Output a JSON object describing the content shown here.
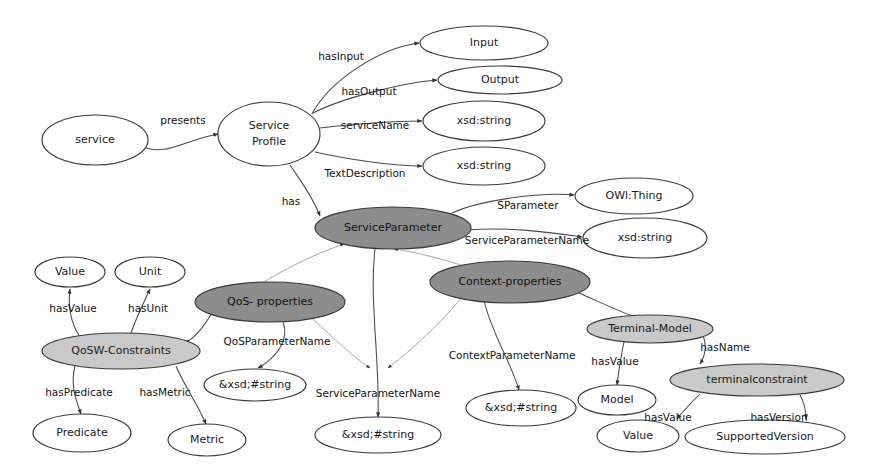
{
  "diagram": {
    "colors": {
      "node_fill_plain": "#ffffff",
      "node_fill_dark": "#8d8d8d",
      "node_fill_light": "#c9c9c9",
      "node_stroke": "#3a3a3a",
      "edge_stroke": "#4a4a4a",
      "edge_stroke_faint": "#9a9a9a",
      "background": "#fdfdfd",
      "text": "#141414"
    },
    "nodes": [
      {
        "id": "service",
        "label": "service",
        "cx": 95,
        "cy": 140,
        "rx": 53,
        "ry": 25,
        "fill": "plain",
        "lines": 1
      },
      {
        "id": "service-profile",
        "label": "Service\nProfile",
        "cx": 269,
        "cy": 134,
        "rx": 51,
        "ry": 32,
        "fill": "plain",
        "lines": 2,
        "line1": "Service",
        "line2": "Profile"
      },
      {
        "id": "input",
        "label": "Input",
        "cx": 484,
        "cy": 43,
        "rx": 64,
        "ry": 17,
        "fill": "plain",
        "lines": 1
      },
      {
        "id": "output",
        "label": "Output",
        "cx": 500,
        "cy": 80,
        "rx": 62,
        "ry": 14,
        "fill": "plain",
        "lines": 1
      },
      {
        "id": "xsd-string-name",
        "label": "xsd:string",
        "cx": 484,
        "cy": 121,
        "rx": 61,
        "ry": 20,
        "fill": "plain",
        "lines": 1
      },
      {
        "id": "xsd-string-desc",
        "label": "xsd:string",
        "cx": 484,
        "cy": 166,
        "rx": 61,
        "ry": 19,
        "fill": "plain",
        "lines": 1
      },
      {
        "id": "owl-thing",
        "label": "OWl:Thing",
        "cx": 634,
        "cy": 196,
        "rx": 59,
        "ry": 18,
        "fill": "plain",
        "lines": 1
      },
      {
        "id": "xsd-string-sparam",
        "label": "xsd:string",
        "cx": 645,
        "cy": 238,
        "rx": 62,
        "ry": 20,
        "fill": "plain",
        "lines": 1
      },
      {
        "id": "service-parameter",
        "label": "ServiceParameter",
        "cx": 393,
        "cy": 228,
        "rx": 78,
        "ry": 21,
        "fill": "dark",
        "lines": 1
      },
      {
        "id": "value-top",
        "label": "Value",
        "cx": 70,
        "cy": 272,
        "rx": 35,
        "ry": 15,
        "fill": "plain",
        "lines": 1
      },
      {
        "id": "unit",
        "label": "Unit",
        "cx": 150,
        "cy": 272,
        "rx": 35,
        "ry": 15,
        "fill": "plain",
        "lines": 1
      },
      {
        "id": "qos-properties",
        "label": "QoS- properties",
        "cx": 270,
        "cy": 302,
        "rx": 75,
        "ry": 20,
        "fill": "dark",
        "lines": 1
      },
      {
        "id": "context-properties",
        "label": "Context-properties",
        "cx": 510,
        "cy": 282,
        "rx": 80,
        "ry": 21,
        "fill": "dark",
        "lines": 1
      },
      {
        "id": "qosw-constraints",
        "label": "QoSW-Constraints",
        "cx": 121,
        "cy": 351,
        "rx": 79,
        "ry": 18,
        "fill": "light",
        "lines": 1
      },
      {
        "id": "terminal-model",
        "label": "Terminal-Model",
        "cx": 650,
        "cy": 329,
        "rx": 63,
        "ry": 14,
        "fill": "light",
        "lines": 1
      },
      {
        "id": "terminalconstraint",
        "label": "terminalconstraint",
        "cx": 757,
        "cy": 380,
        "rx": 87,
        "ry": 16,
        "fill": "light",
        "lines": 1
      },
      {
        "id": "xsd-string-qos",
        "label": "&xsd;#string",
        "cx": 255,
        "cy": 385,
        "rx": 51,
        "ry": 16,
        "fill": "plain",
        "lines": 1
      },
      {
        "id": "xsd-string-context",
        "label": "&xsd;#string",
        "cx": 521,
        "cy": 408,
        "rx": 55,
        "ry": 18,
        "fill": "plain",
        "lines": 1
      },
      {
        "id": "xsd-string-svcparam",
        "label": "&xsd;#string",
        "cx": 378,
        "cy": 435,
        "rx": 63,
        "ry": 18,
        "fill": "plain",
        "lines": 1
      },
      {
        "id": "predicate",
        "label": "Predicate",
        "cx": 82,
        "cy": 433,
        "rx": 49,
        "ry": 19,
        "fill": "plain",
        "lines": 1
      },
      {
        "id": "metric",
        "label": "Metric",
        "cx": 207,
        "cy": 440,
        "rx": 39,
        "ry": 16,
        "fill": "plain",
        "lines": 1
      },
      {
        "id": "model",
        "label": "Model",
        "cx": 617,
        "cy": 400,
        "rx": 39,
        "ry": 15,
        "fill": "plain",
        "lines": 1
      },
      {
        "id": "value-bottom",
        "label": "Value",
        "cx": 638,
        "cy": 436,
        "rx": 41,
        "ry": 16,
        "fill": "plain",
        "lines": 1
      },
      {
        "id": "supported-version",
        "label": "SupportedVersion",
        "cx": 765,
        "cy": 437,
        "rx": 80,
        "ry": 17,
        "fill": "plain",
        "lines": 1
      }
    ],
    "edges": [
      {
        "id": "presents",
        "from": "service",
        "to": "service-profile",
        "label": "presents",
        "label_x": 183,
        "label_y": 121,
        "path": "M 146,148 C 168,155 186,140 218,134",
        "faint": false
      },
      {
        "id": "hasInput",
        "from": "service-profile",
        "to": "input",
        "label": "hasInput",
        "label_x": 341,
        "label_y": 57,
        "path": "M 312,114 C 330,80 380,48 419,43",
        "faint": false
      },
      {
        "id": "hasOutput",
        "from": "service-profile",
        "to": "output",
        "label": "hasOutput",
        "label_x": 369,
        "label_y": 92,
        "path": "M 313,113 C 340,99 400,83 437,80",
        "faint": false
      },
      {
        "id": "serviceName",
        "from": "service-profile",
        "to": "xsd-string-name",
        "label": "serviceName",
        "label_x": 375,
        "label_y": 126,
        "path": "M 320,128 C 355,124 395,121 422,121",
        "faint": false
      },
      {
        "id": "TextDescription",
        "from": "service-profile",
        "to": "xsd-string-desc",
        "label": "TextDescription",
        "label_x": 365,
        "label_y": 174,
        "path": "M 315,152 C 350,160 395,166 422,166",
        "faint": false
      },
      {
        "id": "has",
        "from": "service-profile",
        "to": "service-parameter",
        "label": "has",
        "label_x": 291,
        "label_y": 202,
        "path": "M 290,165 C 300,180 312,195 320,216",
        "faint": false
      },
      {
        "id": "SParameter",
        "from": "service-parameter",
        "to": "owl-thing",
        "label": "SParameter",
        "label_x": 528,
        "label_y": 206,
        "path": "M 452,213 C 480,200 540,192 574,195",
        "faint": false
      },
      {
        "id": "ServiceParameterName",
        "from": "service-parameter",
        "to": "xsd-string-sparam",
        "label": "ServiceParameterName",
        "label_x": 527,
        "label_y": 241,
        "path": "M 468,230 C 510,226 560,234 582,237",
        "faint": false
      },
      {
        "id": "qos-to-serviceparam",
        "from": "qos-properties",
        "to": "service-parameter",
        "label": "",
        "label_x": 0,
        "label_y": 0,
        "path": "M 262,283 C 290,266 320,252 344,244",
        "faint": true
      },
      {
        "id": "context-to-serviceparam",
        "from": "context-properties",
        "to": "service-parameter",
        "label": "",
        "label_x": 0,
        "label_y": 0,
        "path": "M 470,268 C 440,258 410,251 394,249",
        "faint": true
      },
      {
        "id": "hasValue-unit-left",
        "from": "qosw-constraints",
        "to": "value-top",
        "label": "hasValue",
        "label_x": 73,
        "label_y": 309,
        "path": "M 80,337 C 70,322 68,305 70,289",
        "faint": false
      },
      {
        "id": "hasUnit",
        "from": "qosw-constraints",
        "to": "unit",
        "label": "hasUnit",
        "label_x": 148,
        "label_y": 309,
        "path": "M 131,333 C 136,318 144,302 150,289",
        "faint": false
      },
      {
        "id": "qos-to-qosw",
        "from": "qos-properties",
        "to": "qosw-constraints",
        "label": "",
        "label_x": 0,
        "label_y": 0,
        "path": "M 213,311 C 205,325 195,338 185,343",
        "faint": false
      },
      {
        "id": "QoSParameterName",
        "from": "qos-properties",
        "to": "xsd-string-qos",
        "label": "QoSParameterName",
        "label_x": 277,
        "label_y": 342,
        "path": "M 283,322 C 290,340 276,358 258,368",
        "faint": false
      },
      {
        "id": "hasPredicate",
        "from": "qosw-constraints",
        "to": "predicate",
        "label": "hasPredicate",
        "label_x": 79,
        "label_y": 393,
        "path": "M 75,366 C 70,385 76,400 81,414",
        "faint": false
      },
      {
        "id": "hasMetric",
        "from": "qosw-constraints",
        "to": "metric",
        "label": "hasMetric",
        "label_x": 165,
        "label_y": 393,
        "path": "M 176,366 C 184,385 198,405 206,424",
        "faint": false
      },
      {
        "id": "ServiceParameterName2",
        "from": "service-parameter",
        "to": "xsd-string-svcparam",
        "label": "ServiceParameterName",
        "label_x": 378,
        "label_y": 394,
        "path": "M 375,249 C 369,300 380,360 378,417",
        "faint": false
      },
      {
        "id": "qos-diag-to-mid",
        "from": "qos-properties",
        "to": "xsd-string-svcparam",
        "label": "",
        "label_x": 0,
        "label_y": 0,
        "path": "M 312,318 C 335,340 355,358 370,368",
        "faint": true
      },
      {
        "id": "context-diag-to-mid",
        "from": "context-properties",
        "to": "xsd-string-svcparam",
        "label": "",
        "label_x": 0,
        "label_y": 0,
        "path": "M 463,296 C 435,330 405,355 388,368",
        "faint": true
      },
      {
        "id": "ContextParameterName",
        "from": "context-properties",
        "to": "xsd-string-context",
        "label": "ContextParameterName",
        "label_x": 512,
        "label_y": 356,
        "path": "M 484,300 C 490,330 510,360 519,390",
        "faint": false
      },
      {
        "id": "context-to-terminal",
        "from": "context-properties",
        "to": "terminal-model",
        "label": "",
        "label_x": 0,
        "label_y": 0,
        "path": "M 572,290 C 600,302 620,312 638,318",
        "faint": false
      },
      {
        "id": "hasValue-model",
        "from": "terminal-model",
        "to": "model",
        "label": "hasValue",
        "label_x": 615,
        "label_y": 362,
        "path": "M 624,342 C 620,360 618,378 617,385",
        "faint": false
      },
      {
        "id": "hasName",
        "from": "terminal-model",
        "to": "terminalconstraint",
        "label": "hasName",
        "label_x": 725,
        "label_y": 348,
        "path": "M 702,333 C 708,346 705,356 700,364",
        "faint": false
      },
      {
        "id": "hasValue-terminal",
        "from": "terminalconstraint",
        "to": "value-bottom",
        "label": "hasValue",
        "label_x": 668,
        "label_y": 418,
        "path": "M 700,394 C 690,404 682,412 677,419",
        "faint": false
      },
      {
        "id": "hasVersion",
        "from": "terminalconstraint",
        "to": "supported-version",
        "label": "hasVersion",
        "label_x": 779,
        "label_y": 418,
        "path": "M 800,395 C 805,404 806,412 806,419",
        "faint": false
      }
    ]
  }
}
